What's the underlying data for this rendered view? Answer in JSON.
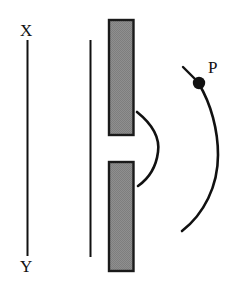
{
  "figure": {
    "background_color": "#ffffff",
    "stroke_color": "#111111",
    "bar_fill_color": "#8a8a8a",
    "bar_border_color": "#1a1a1a",
    "width": 237,
    "height": 283
  },
  "labels": {
    "top_left": "X",
    "bottom_left": "Y",
    "point": "P"
  },
  "elements": {
    "source_line": {
      "name": "X-Y vertical line",
      "x": 27,
      "y_top": 40,
      "y_bottom": 256,
      "stroke_width": 2
    },
    "wavefront_line": {
      "name": "plane wavefront line",
      "x": 90,
      "y_top": 40,
      "y_bottom": 257,
      "stroke_width": 2
    },
    "barrier_upper": {
      "name": "upper barrier block",
      "x": 108,
      "y": 19,
      "width": 26,
      "height": 117
    },
    "barrier_lower": {
      "name": "lower barrier block",
      "x": 108,
      "y": 161,
      "width": 26,
      "height": 111
    },
    "slit_gap": {
      "name": "slit aperture",
      "y_top": 136,
      "y_bottom": 161,
      "height": 25
    },
    "small_arc": {
      "name": "diffracted wavelet arc",
      "path": "M 137 112 C 152 124 160 138 158 152 C 156 168 148 179 138 186",
      "stroke_width": 2.6
    },
    "large_arc": {
      "name": "outgoing wavefront arc",
      "path": "M 199 84 C 211 104 218 130 218 155 C 218 186 204 214 182 231",
      "stroke_width": 2.6
    },
    "point_marker": {
      "name": "point P marker dot",
      "cx": 199,
      "cy": 83,
      "r": 6.2
    },
    "point_tick": {
      "name": "tick line to point P",
      "x1": 183,
      "y1": 67,
      "x2": 200,
      "y2": 84,
      "stroke_width": 2.4
    }
  },
  "label_positions": {
    "top_left": {
      "x": 20,
      "y": 36
    },
    "bottom_left": {
      "x": 20,
      "y": 272
    },
    "point": {
      "x": 208,
      "y": 73
    }
  }
}
